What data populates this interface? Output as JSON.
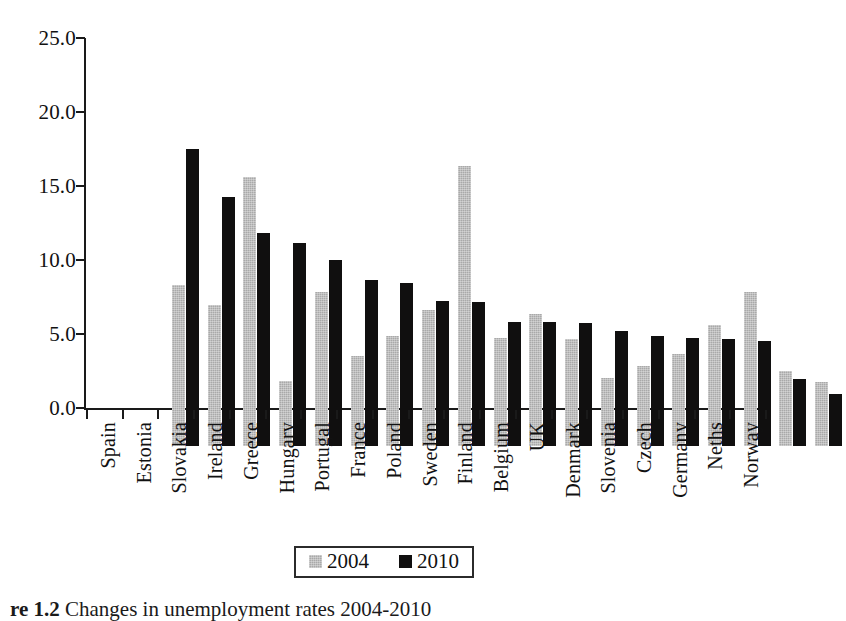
{
  "chart_data": {
    "type": "bar",
    "title": "",
    "xlabel": "",
    "ylabel": "",
    "ylim": [
      0,
      25
    ],
    "ytick_step": 5,
    "grid": false,
    "legend_position": "bottom-center",
    "categories": [
      "Spain",
      "Estonia",
      "Slovakia",
      "Ireland",
      "Greece",
      "Hungary",
      "Portugal",
      "France",
      "Poland",
      "Sweden",
      "Finland",
      "Belgium",
      "UK",
      "Denmark",
      "Slovenia",
      "Czech",
      "Germany",
      "Neths",
      "Norway"
    ],
    "series": [
      {
        "name": "2004",
        "color": "#a9a9a9",
        "values": [
          10.9,
          9.5,
          18.2,
          4.4,
          10.4,
          6.1,
          7.4,
          9.2,
          18.9,
          7.3,
          8.9,
          7.2,
          4.6,
          5.4,
          6.2,
          8.2,
          10.4,
          5.1,
          4.3
        ]
      },
      {
        "name": "2010",
        "color": "#100f0f",
        "values": [
          20.1,
          16.8,
          14.4,
          13.7,
          12.6,
          11.2,
          11.0,
          9.8,
          9.7,
          8.4,
          8.4,
          8.3,
          7.8,
          7.4,
          7.3,
          7.2,
          7.1,
          4.5,
          3.5
        ]
      }
    ],
    "ytick_labels": [
      "25.0",
      "20.0",
      "15.0",
      "10.0",
      "5.0",
      "0.0"
    ],
    "ytick_values": [
      25.0,
      20.0,
      15.0,
      10.0,
      5.0,
      0.0
    ]
  },
  "legend": {
    "entries": [
      {
        "label": "2004",
        "swatch": "grey-swatch"
      },
      {
        "label": "2010",
        "swatch": "black-swatch"
      }
    ]
  },
  "caption": {
    "number": "re 1.2",
    "text": "Changes in unemployment rates 2004-2010"
  }
}
